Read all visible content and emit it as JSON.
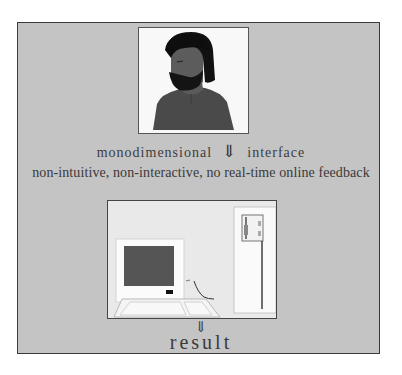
{
  "diagram": {
    "top_figure": {
      "icon": "user-portrait-icon",
      "description": "bearded man portrait"
    },
    "interface_line": {
      "left_label": "monodimensional",
      "arrow": "⇓",
      "right_label": "interface"
    },
    "characteristics": "non-intuitive, non-interactive, no real-time online feedback",
    "bottom_figure": {
      "icon": "desktop-computer-icon",
      "description": "desktop computer with monitor, keyboard and tower"
    },
    "output_arrow": "⇓",
    "output_label": "result"
  },
  "colors": {
    "frame_bg": "#c4c4c4",
    "frame_border": "#3a3a3a",
    "text": "#3a3a3a"
  }
}
